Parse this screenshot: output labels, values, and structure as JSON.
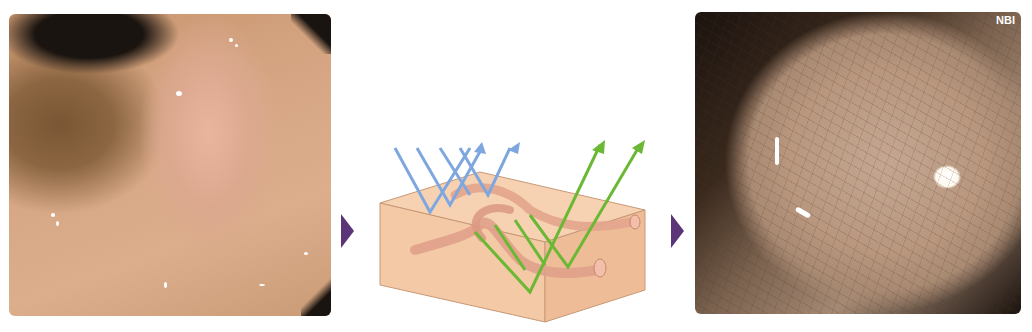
{
  "figure": {
    "left_panel": {
      "description": "White-light endoscopic image of an elevated mucosal lesion"
    },
    "middle_panel": {
      "description": "Schematic of narrow-band light penetrating tissue block with blood vessels",
      "light_colors": {
        "blue": "#7aa6e0",
        "green": "#6ec23a"
      },
      "tissue_color": "#f3caa8",
      "vessel_color": "#e3a08a"
    },
    "right_panel": {
      "description": "Narrow-band imaging endoscopic view showing surface vessel pattern",
      "mode_label": "NBI"
    },
    "arrow_color": "#5c3478"
  }
}
